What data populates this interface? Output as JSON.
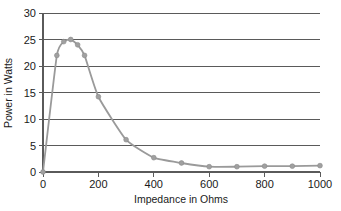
{
  "chart_data": {
    "type": "line",
    "title": "",
    "xlabel": "Impedance in Ohms",
    "ylabel": "Power in Watts",
    "xlim": [
      0,
      1000
    ],
    "ylim": [
      0,
      30
    ],
    "xticks": [
      0,
      200,
      400,
      600,
      800,
      1000
    ],
    "xtick_labels": [
      "0",
      "200",
      "400",
      "600",
      "800",
      "1000"
    ],
    "yticks": [
      0,
      5,
      10,
      15,
      20,
      25,
      30
    ],
    "ytick_labels": [
      "0",
      "5",
      "10",
      "15",
      "20",
      "25",
      "30"
    ],
    "grid": "horizontal",
    "legend": "none",
    "marker": "circle",
    "line_color": "#9a9a9a",
    "marker_color": "#a0a0a0",
    "axis_color": "#5a5a5a",
    "background_color": "#ffffff",
    "series": [
      {
        "name": "Power delivered to load",
        "x": [
          0,
          50,
          75,
          100,
          125,
          150,
          200,
          300,
          400,
          500,
          600,
          700,
          800,
          900,
          1000
        ],
        "values": [
          0,
          22,
          24.6,
          25,
          24,
          22,
          14.2,
          6.1,
          2.7,
          1.7,
          1.0,
          1.0,
          1.1,
          1.1,
          1.2
        ]
      }
    ]
  },
  "axes": {
    "x_title": "Impedance in Ohms",
    "y_title": "Power in Watts"
  },
  "ticks": {
    "y": [
      "30",
      "25",
      "20",
      "15",
      "10",
      "5",
      "0"
    ],
    "x": [
      "0",
      "200",
      "400",
      "600",
      "800",
      "1000"
    ]
  }
}
